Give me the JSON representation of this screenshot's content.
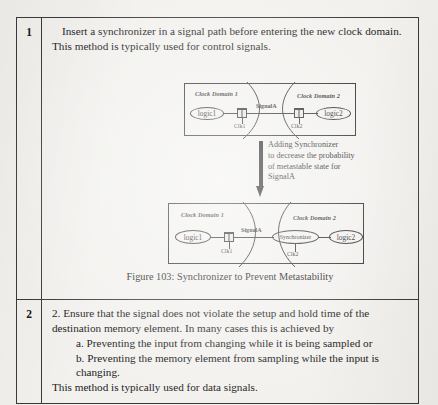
{
  "document": {
    "rows": [
      {
        "number": "1",
        "text": "Insert a synchronizer in a signal path before entering the new clock domain. This method is typically used for control signals."
      },
      {
        "number": "2",
        "lines": [
          "2. Ensure that the signal does not violate the setup and hold time of the destination memory element. In many cases this is achieved by",
          "a. Preventing the input from changing while it is being sampled or",
          "b. Preventing the memory element from sampling while the input is changing.",
          "This method is typically used for data signals."
        ]
      }
    ]
  },
  "figure": {
    "caption": "Figure 103: Synchronizer to Prevent Metastability",
    "transition_note": {
      "line1": "Adding Synchronizer",
      "line2": "to decrease the probability",
      "line3": "of metastable state for",
      "line4": "SignalA"
    },
    "diagram_before": {
      "domain1_label": "Clock Domain 1",
      "domain2_label": "Clock Domain 2",
      "logic1": "logic1",
      "logic2": "logic2",
      "clk1": "Clk1",
      "clk2": "Clk2",
      "signal": "SignalA"
    },
    "diagram_after": {
      "domain1_label": "Clock Domain 1",
      "domain2_label": "Clock Domain 2",
      "logic1": "logic1",
      "logic2": "logic2",
      "synchronizer": "Synchronizer",
      "clk1": "Clk1",
      "clk2": "Clk2",
      "signal": "SignalA"
    }
  },
  "colors": {
    "page_background": "#f2f1ee",
    "ink": "#1a1a1a",
    "border": "#3a3a3a"
  }
}
